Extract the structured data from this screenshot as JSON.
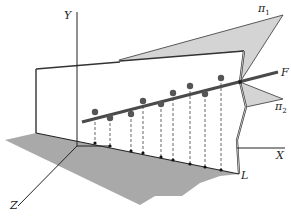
{
  "figure": {
    "type": "3d-geometric-diagram",
    "colors": {
      "plane_fill": "#d4d4d4",
      "floor_shadow": "#a9a9a9",
      "line": "#444444",
      "axis": "#222222",
      "point": "#555555"
    }
  },
  "labels": {
    "y_axis": "Y",
    "x_axis": "X",
    "z_axis": "Z",
    "line_f": "F",
    "line_l": "L",
    "plane1": "π",
    "plane1_sub": "1",
    "plane2": "π",
    "plane2_sub": "2"
  },
  "points": [
    {
      "x": 95,
      "y": 112,
      "foot_x": 95,
      "foot_y": 143
    },
    {
      "x": 110,
      "y": 118,
      "foot_x": 110,
      "foot_y": 146
    },
    {
      "x": 131,
      "y": 114,
      "foot_x": 131,
      "foot_y": 151
    },
    {
      "x": 143,
      "y": 101,
      "foot_x": 143,
      "foot_y": 153
    },
    {
      "x": 161,
      "y": 104,
      "foot_x": 161,
      "foot_y": 157
    },
    {
      "x": 173,
      "y": 93,
      "foot_x": 173,
      "foot_y": 160
    },
    {
      "x": 190,
      "y": 86,
      "foot_x": 190,
      "foot_y": 164
    },
    {
      "x": 205,
      "y": 94,
      "foot_x": 205,
      "foot_y": 167
    },
    {
      "x": 221,
      "y": 78,
      "foot_x": 221,
      "foot_y": 170
    }
  ]
}
